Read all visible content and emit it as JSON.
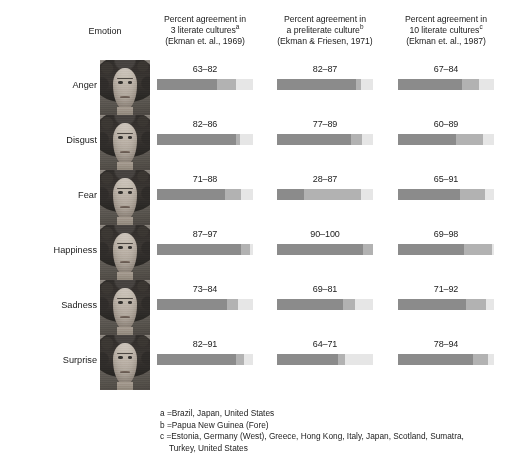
{
  "figure": {
    "emotion_column_header": "Emotion",
    "columns": [
      {
        "id": "col-3-literate",
        "line1": "Percent agreement in",
        "line2": "3 literate cultures",
        "superscript": "a",
        "line3": "(Ekman et. al., 1969)"
      },
      {
        "id": "col-preliterate",
        "line1": "Percent agreement in",
        "line2": "a preliterate culture",
        "superscript": "b",
        "line3": "(Ekman & Friesen, 1971)"
      },
      {
        "id": "col-10-literate",
        "line1": "Percent agreement in",
        "line2": "10 literate cultures",
        "superscript": "c",
        "line3": "(Ekman et. al., 1987)"
      }
    ],
    "rows": [
      {
        "emotion": "Anger",
        "face_icon": "anger-face-photo",
        "cells": [
          {
            "label": "63–82",
            "low": 63,
            "high": 82
          },
          {
            "label": "82–87",
            "low": 82,
            "high": 87
          },
          {
            "label": "67–84",
            "low": 67,
            "high": 84
          }
        ]
      },
      {
        "emotion": "Disgust",
        "face_icon": "disgust-face-photo",
        "cells": [
          {
            "label": "82–86",
            "low": 82,
            "high": 86
          },
          {
            "label": "77–89",
            "low": 77,
            "high": 89
          },
          {
            "label": "60–89",
            "low": 60,
            "high": 89
          }
        ]
      },
      {
        "emotion": "Fear",
        "face_icon": "fear-face-photo",
        "cells": [
          {
            "label": "71–88",
            "low": 71,
            "high": 88
          },
          {
            "label": "28–87",
            "low": 28,
            "high": 87
          },
          {
            "label": "65–91",
            "low": 65,
            "high": 91
          }
        ]
      },
      {
        "emotion": "Happiness",
        "face_icon": "happiness-face-photo",
        "cells": [
          {
            "label": "87–97",
            "low": 87,
            "high": 97
          },
          {
            "label": "90–100",
            "low": 90,
            "high": 100
          },
          {
            "label": "69–98",
            "low": 69,
            "high": 98
          }
        ]
      },
      {
        "emotion": "Sadness",
        "face_icon": "sadness-face-photo",
        "cells": [
          {
            "label": "73–84",
            "low": 73,
            "high": 84
          },
          {
            "label": "69–81",
            "low": 69,
            "high": 81
          },
          {
            "label": "71–92",
            "low": 71,
            "high": 92
          }
        ]
      },
      {
        "emotion": "Surprise",
        "face_icon": "surprise-face-photo",
        "cells": [
          {
            "label": "82–91",
            "low": 82,
            "high": 91
          },
          {
            "label": "64–71",
            "low": 64,
            "high": 71
          },
          {
            "label": "78–94",
            "low": 78,
            "high": 94
          }
        ]
      }
    ],
    "footnotes": [
      {
        "key": "a =",
        "text": "Brazil, Japan, United States"
      },
      {
        "key": "b =",
        "text": "Papua New Guinea (Fore)"
      },
      {
        "key": "c =",
        "text": "Estonia, Germany (West), Greece, Hong Kong, Italy, Japan, Scotland, Sumatra,",
        "continuation": "Turkey, United States"
      }
    ],
    "colors": {
      "background": "#ffffff",
      "bar_low": "#8b8b8b",
      "bar_mid": "#b2b2b2",
      "bar_remainder": "#e6e6e6",
      "text": "#1b1b1b"
    }
  },
  "chart_data": {
    "type": "bar",
    "title": "",
    "xlabel": "Percent agreement",
    "ylabel": "Emotion",
    "xlim": [
      0,
      100
    ],
    "grid": false,
    "legend_position": "none",
    "categories": [
      "Anger",
      "Disgust",
      "Fear",
      "Happiness",
      "Sadness",
      "Surprise"
    ],
    "series": [
      {
        "name": "Percent agreement in 3 literate cultures (Ekman et. al., 1969)",
        "footnote": "a",
        "ranges": [
          [
            63,
            82
          ],
          [
            82,
            86
          ],
          [
            71,
            88
          ],
          [
            87,
            97
          ],
          [
            73,
            84
          ],
          [
            82,
            91
          ]
        ],
        "labels": [
          "63–82",
          "82–86",
          "71–88",
          "87–97",
          "73–84",
          "82–91"
        ]
      },
      {
        "name": "Percent agreement in a preliterate culture (Ekman & Friesen, 1971)",
        "footnote": "b",
        "ranges": [
          [
            82,
            87
          ],
          [
            77,
            89
          ],
          [
            28,
            87
          ],
          [
            90,
            100
          ],
          [
            69,
            81
          ],
          [
            64,
            71
          ]
        ],
        "labels": [
          "82–87",
          "77–89",
          "28–87",
          "90–100",
          "69–81",
          "64–71"
        ]
      },
      {
        "name": "Percent agreement in 10 literate cultures (Ekman et. al., 1987)",
        "footnote": "c",
        "ranges": [
          [
            67,
            84
          ],
          [
            60,
            89
          ],
          [
            65,
            91
          ],
          [
            69,
            98
          ],
          [
            71,
            92
          ],
          [
            78,
            94
          ]
        ],
        "labels": [
          "67–84",
          "60–89",
          "65–91",
          "69–98",
          "71–92",
          "78–94"
        ]
      }
    ],
    "annotations": [
      "a = Brazil, Japan, United States",
      "b = Papua New Guinea (Fore)",
      "c = Estonia, Germany (West), Greece, Hong Kong, Italy, Japan, Scotland, Sumatra, Turkey, United States"
    ]
  }
}
